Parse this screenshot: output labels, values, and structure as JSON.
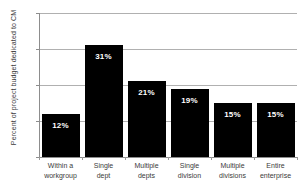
{
  "chart_data": {
    "type": "bar",
    "title": "",
    "title_remnant": "",
    "xlabel": "",
    "ylabel": "Percent of project budget dedicated to CM",
    "categories": [
      "Within a workgroup",
      "Single dept",
      "Multiple depts",
      "Single division",
      "Multiple divisions",
      "Entire enterprise"
    ],
    "category_lines": [
      [
        "Within a",
        "workgroup"
      ],
      [
        "Single",
        "dept"
      ],
      [
        "Multiple",
        "depts"
      ],
      [
        "Single",
        "division"
      ],
      [
        "Multiple",
        "divisions"
      ],
      [
        "Entire",
        "enterprise"
      ]
    ],
    "values": [
      12,
      31,
      21,
      19,
      15,
      15
    ],
    "data_labels": [
      "12%",
      "31%",
      "21%",
      "19%",
      "15%",
      "15%"
    ],
    "ylim": [
      0,
      40
    ],
    "ytick_values": [
      0,
      10,
      20,
      30,
      40
    ],
    "ytick_labels": [
      "0%",
      "10%",
      "20%",
      "30%",
      "40%"
    ],
    "grid": true,
    "legend": false,
    "bar_color": "#000000",
    "data_label_color": "#ffffff",
    "grid_color": "#b0b0b0",
    "axis_color": "#8d8d8d",
    "background": "#ffffff"
  }
}
